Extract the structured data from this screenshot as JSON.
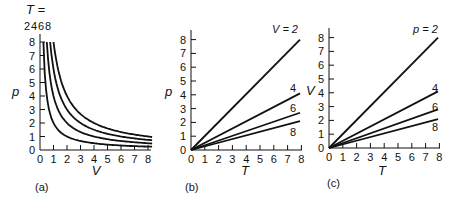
{
  "figure": {
    "panels": [
      "(a)",
      "(b)",
      "(c)"
    ]
  },
  "chart_data": [
    {
      "type": "line",
      "panel_label": "(a)",
      "title": "",
      "xlabel": "V",
      "ylabel": "p",
      "xlim": [
        0,
        8.5
      ],
      "ylim": [
        0,
        8.5
      ],
      "xticks": [
        0,
        1,
        2,
        3,
        4,
        5,
        6,
        7,
        8
      ],
      "yticks": [
        0,
        1,
        2,
        3,
        4,
        5,
        6,
        7,
        8
      ],
      "grid": false,
      "legend_header": "T =",
      "legend_position": "top, above curves",
      "relation": "p = T / V (isotherms)",
      "series": [
        {
          "name": "2",
          "x": [
            0.25,
            0.5,
            1,
            2,
            3,
            4,
            5,
            6,
            7,
            8.3
          ],
          "y": [
            8.0,
            4.0,
            2.0,
            1.0,
            0.67,
            0.5,
            0.4,
            0.33,
            0.29,
            0.24
          ]
        },
        {
          "name": "4",
          "x": [
            0.5,
            1,
            2,
            3,
            4,
            5,
            6,
            7,
            8.3
          ],
          "y": [
            8.0,
            4.0,
            2.0,
            1.33,
            1.0,
            0.8,
            0.67,
            0.57,
            0.48
          ]
        },
        {
          "name": "6",
          "x": [
            0.75,
            1,
            2,
            3,
            4,
            5,
            6,
            7,
            8.3
          ],
          "y": [
            8.0,
            6.0,
            3.0,
            2.0,
            1.5,
            1.2,
            1.0,
            0.86,
            0.72
          ]
        },
        {
          "name": "8",
          "x": [
            1,
            2,
            3,
            4,
            5,
            6,
            7,
            8.3
          ],
          "y": [
            8.0,
            4.0,
            2.67,
            2.0,
            1.6,
            1.33,
            1.14,
            0.96
          ]
        }
      ]
    },
    {
      "type": "line",
      "panel_label": "(b)",
      "title": "",
      "xlabel": "T",
      "ylabel": "p",
      "xlim": [
        0,
        8
      ],
      "ylim": [
        0,
        8.5
      ],
      "xticks": [
        0,
        1,
        2,
        3,
        4,
        5,
        6,
        7,
        8
      ],
      "yticks": [
        0,
        1,
        2,
        3,
        4,
        5,
        6,
        7,
        8
      ],
      "grid": false,
      "relation": "p = T / V (isochores)",
      "series": [
        {
          "name": "V = 2",
          "x": [
            0,
            8
          ],
          "y": [
            0,
            4.0
          ]
        },
        {
          "name": "4",
          "x": [
            0,
            8
          ],
          "y": [
            0,
            2.0
          ]
        },
        {
          "name": "6",
          "x": [
            0,
            8
          ],
          "y": [
            0,
            1.33
          ]
        },
        {
          "name": "8",
          "x": [
            0,
            8
          ],
          "y": [
            0,
            1.0
          ]
        }
      ],
      "drawn_endpoints": {
        "V = 2": 8.0,
        "4": 4.1,
        "6": 2.7,
        "8": 2.1
      }
    },
    {
      "type": "line",
      "panel_label": "(c)",
      "title": "",
      "xlabel": "T",
      "ylabel": "V",
      "xlim": [
        0,
        8
      ],
      "ylim": [
        0,
        8.5
      ],
      "xticks": [
        0,
        1,
        2,
        3,
        4,
        5,
        6,
        7,
        8
      ],
      "yticks": [
        0,
        1,
        2,
        3,
        4,
        5,
        6,
        7,
        8
      ],
      "grid": false,
      "relation": "V = T / p (isobars)",
      "series": [
        {
          "name": "p = 2",
          "x": [
            0,
            8
          ],
          "y": [
            0,
            8.0
          ]
        },
        {
          "name": "4",
          "x": [
            0,
            8
          ],
          "y": [
            0,
            4.1
          ]
        },
        {
          "name": "6",
          "x": [
            0,
            8
          ],
          "y": [
            0,
            2.8
          ]
        },
        {
          "name": "8",
          "x": [
            0,
            8
          ],
          "y": [
            0,
            2.1
          ]
        }
      ]
    }
  ],
  "labels": {
    "a": {
      "legend_header": "T =",
      "series_labels": [
        "2",
        "4",
        "6",
        "8"
      ],
      "xlabel": "V",
      "ylabel": "p",
      "panel": "(a)"
    },
    "b": {
      "series_labels": [
        "V = 2",
        "4",
        "6",
        "8"
      ],
      "xlabel": "T",
      "ylabel": "p",
      "panel": "(b)"
    },
    "c": {
      "series_labels": [
        "p = 2",
        "4",
        "6",
        "8"
      ],
      "xlabel": "T",
      "ylabel": "V",
      "panel": "(c)"
    }
  },
  "ticks": [
    "0",
    "1",
    "2",
    "3",
    "4",
    "5",
    "6",
    "7",
    "8"
  ]
}
